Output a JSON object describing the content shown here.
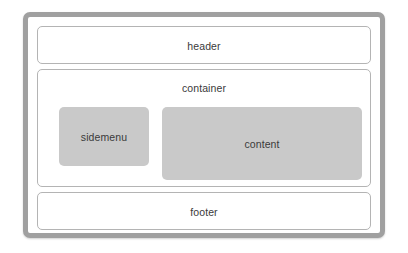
{
  "diagram": {
    "background_color": "#ffffff",
    "frame": {
      "name": "page",
      "border_color": "#a0a0a0"
    },
    "regions": [
      {
        "key": "header",
        "label": "header",
        "fill": "#ffffff",
        "border_color": "#b4b4b4"
      },
      {
        "key": "container",
        "label": "container",
        "fill": "#ffffff",
        "border_color": "#b4b4b4"
      },
      {
        "key": "footer",
        "label": "footer",
        "fill": "#ffffff",
        "border_color": "#b4b4b4"
      }
    ],
    "blocks": [
      {
        "key": "sidemenu",
        "label": "sidemenu",
        "fill": "#c9c9c9"
      },
      {
        "key": "content",
        "label": "content",
        "fill": "#c9c9c9"
      }
    ],
    "text_color": "#3a3a3a"
  }
}
